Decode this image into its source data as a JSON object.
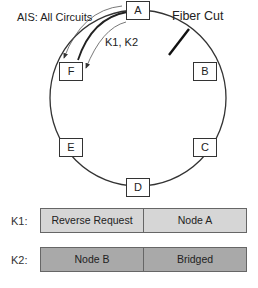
{
  "diagram": {
    "title_annotation": "AIS: All Circuits",
    "fiber_cut_label": "Fiber Cut",
    "signal_label": "K1, K2",
    "nodes": [
      {
        "id": "A",
        "label": "A"
      },
      {
        "id": "B",
        "label": "B"
      },
      {
        "id": "C",
        "label": "C"
      },
      {
        "id": "D",
        "label": "D"
      },
      {
        "id": "E",
        "label": "E"
      },
      {
        "id": "F",
        "label": "F"
      }
    ]
  },
  "bytes": {
    "k1": {
      "label": "K1:",
      "cells": [
        "Reverse Request",
        "Node A"
      ],
      "color": "#d6d6d6"
    },
    "k2": {
      "label": "K2:",
      "cells": [
        "Node B",
        "Bridged"
      ],
      "color": "#a9a9a9"
    }
  }
}
